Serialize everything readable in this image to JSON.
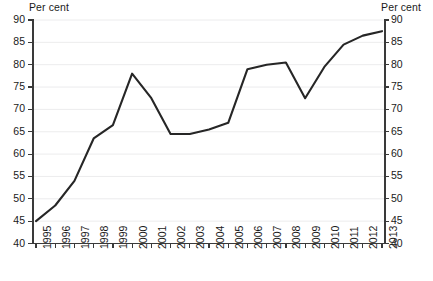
{
  "chart_data": {
    "type": "line",
    "title": "",
    "subtitle": "",
    "xlabel": "",
    "ylabel": "Per cent",
    "ylabel_right": "Per cent",
    "ylim": [
      40,
      90
    ],
    "yticks": [
      40,
      45,
      50,
      55,
      60,
      65,
      70,
      75,
      80,
      85,
      90
    ],
    "yticks_right": [
      40,
      45,
      50,
      55,
      60,
      65,
      70,
      75,
      80,
      85,
      90
    ],
    "grid": true,
    "legend": "none",
    "line_color": "#262626",
    "categories": [
      "1995",
      "1996",
      "1997",
      "1998",
      "1999",
      "2000",
      "2001",
      "2002",
      "2003",
      "2004",
      "2005",
      "2006",
      "2007",
      "2008",
      "2009",
      "2010",
      "2011",
      "2012",
      "2013"
    ],
    "x": [
      1995,
      1996,
      1997,
      1998,
      1999,
      2000,
      2001,
      2002,
      2003,
      2004,
      2005,
      2006,
      2007,
      2008,
      2009,
      2010,
      2011,
      2012,
      2013
    ],
    "values": [
      45.0,
      48.5,
      54.0,
      63.5,
      66.5,
      78.0,
      72.5,
      64.5,
      64.5,
      65.5,
      67.0,
      79.0,
      80.0,
      80.5,
      72.5,
      79.5,
      84.5,
      86.5,
      87.5
    ],
    "series": [
      {
        "name": "Per cent",
        "values": [
          45.0,
          48.5,
          54.0,
          63.5,
          66.5,
          78.0,
          72.5,
          64.5,
          64.5,
          65.5,
          67.0,
          79.0,
          80.0,
          80.5,
          72.5,
          79.5,
          84.5,
          86.5,
          87.5
        ]
      }
    ]
  },
  "axes": {
    "left_title": "Per cent",
    "right_title": "Per cent"
  }
}
